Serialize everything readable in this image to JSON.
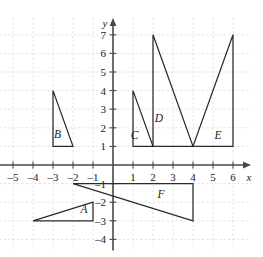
{
  "figure": {
    "kind": "coordinate-plane-diagram",
    "background_color": "#ffffff",
    "grid_color": "#d9d9dd",
    "axis_color": "#4a4a4a",
    "shape_stroke_color": "#2b2b2b"
  },
  "axes": {
    "x_axis_name": "x",
    "y_axis_name": "y",
    "x_tick_labels": [
      "–5",
      "–4",
      "–3",
      "–2",
      "–1",
      "1",
      "2",
      "3",
      "4",
      "5",
      "6"
    ],
    "x_tick_values": [
      -5,
      -4,
      -3,
      -2,
      -1,
      1,
      2,
      3,
      4,
      5,
      6
    ],
    "y_tick_labels": [
      "7",
      "6",
      "5",
      "4",
      "3",
      "2",
      "1",
      "–1",
      "–2",
      "–3",
      "–4"
    ],
    "y_tick_values": [
      7,
      6,
      5,
      4,
      3,
      2,
      1,
      -1,
      -2,
      -3,
      -4
    ],
    "xlim": [
      -5.9,
      6.9
    ],
    "ylim": [
      -4.6,
      7.9
    ],
    "grid": true,
    "grid_style": "dashed"
  },
  "chart_data": {
    "type": "scatter",
    "title": "",
    "xlabel": "x",
    "ylabel": "y",
    "xlim": [
      -5.9,
      6.9
    ],
    "ylim": [
      -4.6,
      7.9
    ],
    "grid": true,
    "legend": "none",
    "shapes": [
      {
        "label": "A",
        "shape": "right triangle",
        "vertices": [
          [
            -4,
            -3
          ],
          [
            -1,
            -3
          ],
          [
            -1,
            -2
          ]
        ],
        "label_position": [
          -1.45,
          -2.6
        ]
      },
      {
        "label": "B",
        "shape": "right triangle",
        "vertices": [
          [
            -3,
            4
          ],
          [
            -3,
            1
          ],
          [
            -2,
            1
          ]
        ],
        "label_position": [
          -2.78,
          1.45
        ]
      },
      {
        "label": "C",
        "shape": "right triangle",
        "vertices": [
          [
            1,
            4
          ],
          [
            1,
            1
          ],
          [
            2,
            1
          ]
        ],
        "label_position": [
          1.08,
          1.4
        ]
      },
      {
        "label": "D",
        "shape": "right triangle",
        "vertices": [
          [
            2,
            7
          ],
          [
            2,
            1
          ],
          [
            4,
            1
          ]
        ],
        "label_position": [
          2.3,
          2.3
        ]
      },
      {
        "label": "E",
        "shape": "right triangle",
        "vertices": [
          [
            6,
            7
          ],
          [
            6,
            1
          ],
          [
            4,
            1
          ]
        ],
        "label_position": [
          5.25,
          1.4
        ]
      },
      {
        "label": "F",
        "shape": "right triangle",
        "vertices": [
          [
            -2,
            -1
          ],
          [
            4,
            -1
          ],
          [
            4,
            -3
          ]
        ],
        "label_position": [
          2.4,
          -1.75
        ]
      }
    ]
  }
}
